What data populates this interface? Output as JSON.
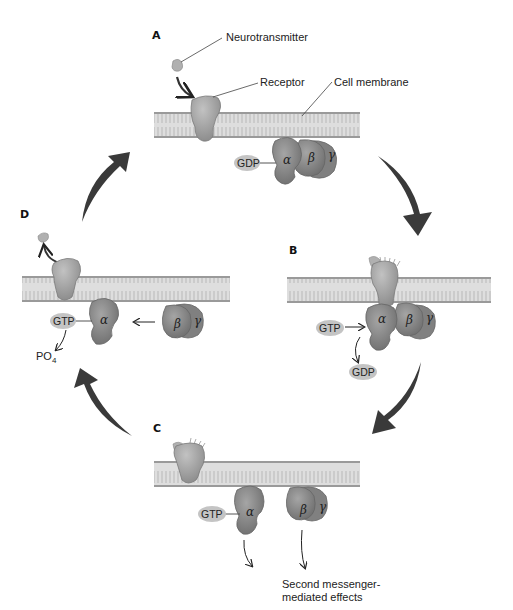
{
  "diagram": {
    "colors": {
      "membrane_fill": "#dcdcdc",
      "membrane_edge": "#9a9a9a",
      "protein_fill": "#8e8e8e",
      "receptor_fill": "#a8a8a8",
      "pill_fill": "#c4c4c4",
      "cycle_arrow": "#3a3a3a",
      "background": "#ffffff"
    },
    "panels": {
      "A": {
        "label": "A",
        "callouts": {
          "neurotransmitter": "Neurotransmitter",
          "receptor": "Receptor",
          "cell_membrane": "Cell membrane"
        },
        "alpha": "α",
        "beta": "β",
        "gamma": "γ",
        "nucleotide": "GDP"
      },
      "B": {
        "label": "B",
        "alpha": "α",
        "beta": "β",
        "gamma": "γ",
        "incoming": "GTP",
        "released": "GDP"
      },
      "C": {
        "label": "C",
        "alpha": "α",
        "beta": "β",
        "gamma": "γ",
        "nucleotide": "GTP",
        "effects_line1": "Second messenger-",
        "effects_line2": "mediated effects"
      },
      "D": {
        "label": "D",
        "alpha": "α",
        "beta": "β",
        "gamma": "γ",
        "nucleotide": "GTP",
        "product": "PO",
        "product_subscript": "4"
      }
    },
    "cycle_order": [
      "A",
      "B",
      "C",
      "D"
    ]
  }
}
